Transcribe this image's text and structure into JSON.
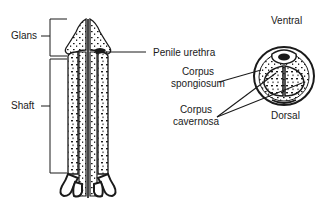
{
  "diagram": {
    "type": "anatomical",
    "longitudinal_view": {
      "labels": {
        "glans": "Glans",
        "shaft": "Shaft",
        "penile_urethra": "Penile urethra"
      }
    },
    "cross_section_view": {
      "labels": {
        "ventral": "Ventral",
        "dorsal": "Dorsal",
        "corpus_spongiosum_line1": "Corpus",
        "corpus_spongiosum_line2": "spongiosum",
        "corpus_cavernosa_line1": "Corpus",
        "corpus_cavernosa_line2": "cavernosa"
      }
    },
    "colors": {
      "ink": "#1a1a1a",
      "background": "#ffffff"
    }
  }
}
